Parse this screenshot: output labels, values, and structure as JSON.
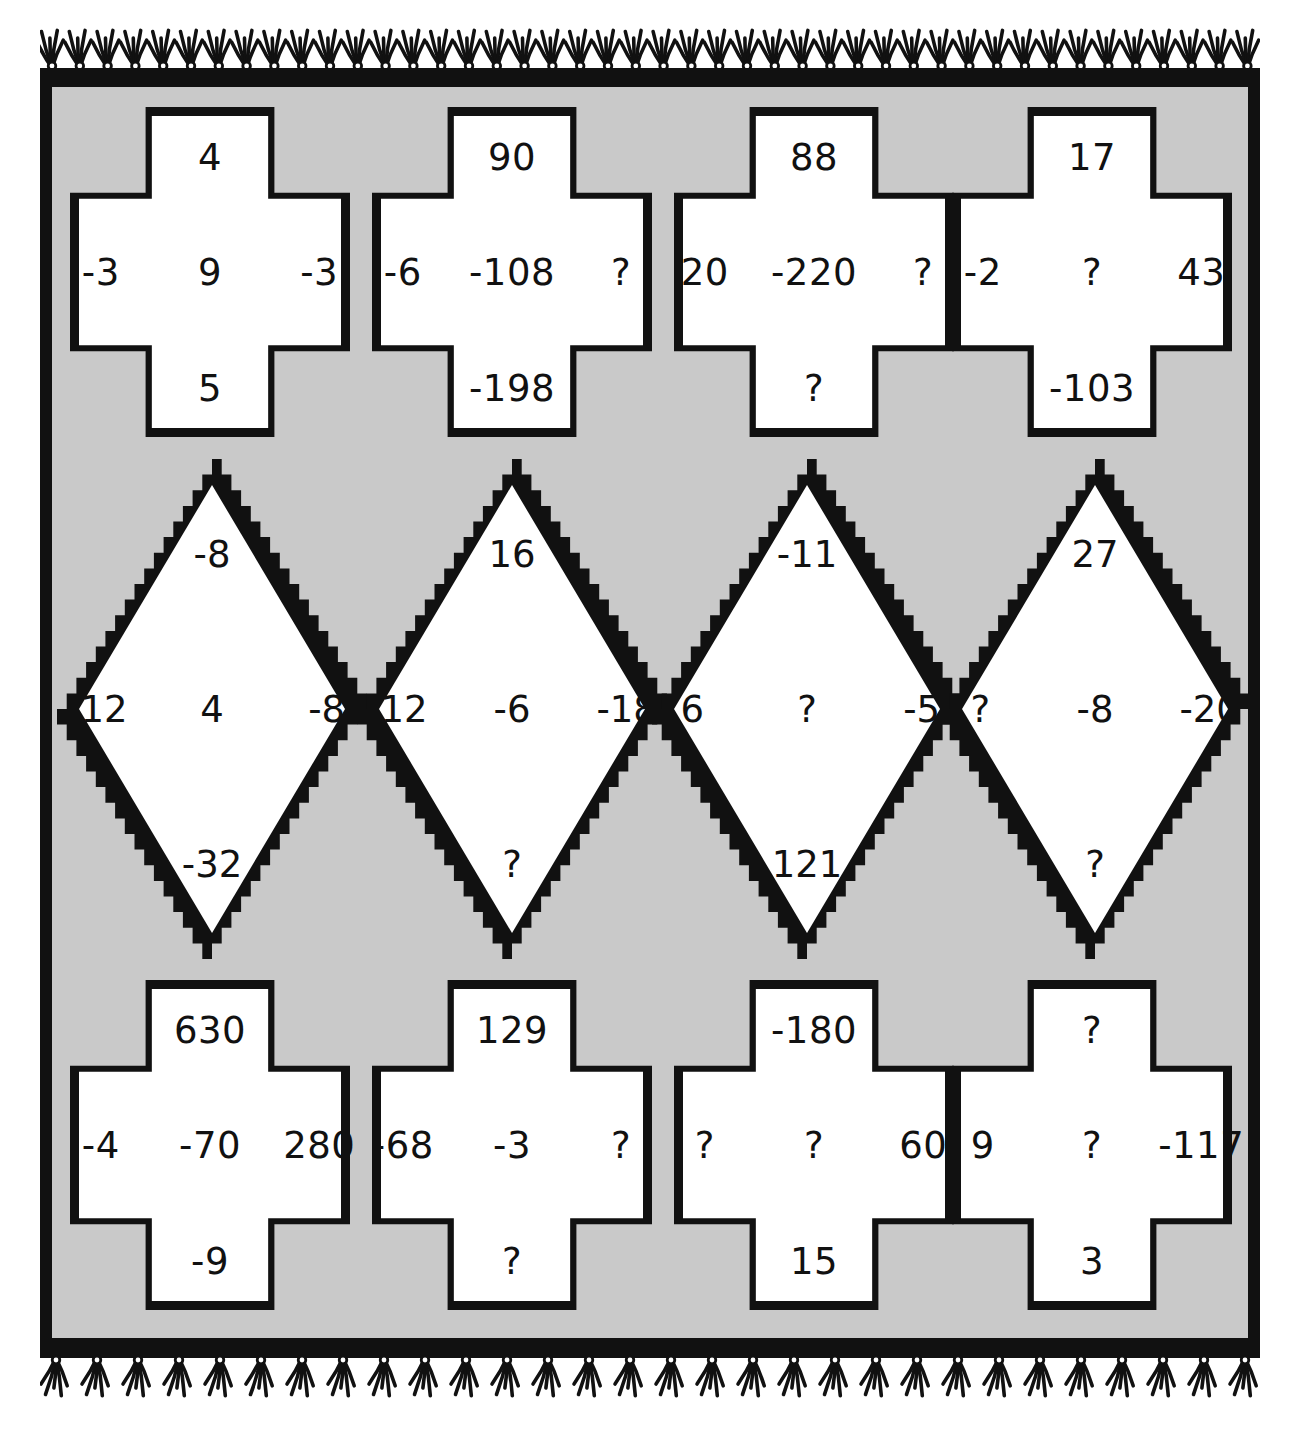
{
  "puzzle": {
    "background_color": "#c9c9c9",
    "ink_color": "#111111",
    "cell_fill_color": "#ffffff",
    "unknown_marker": "?",
    "top_row": [
      {
        "top": "4",
        "left": "-3",
        "center": "9",
        "right": "-3",
        "bottom": "5"
      },
      {
        "top": "90",
        "left": "-6",
        "center": "-108",
        "right": "?",
        "bottom": "-198"
      },
      {
        "top": "88",
        "left": "20",
        "center": "-220",
        "right": "?",
        "bottom": "?"
      },
      {
        "top": "17",
        "left": "-2",
        "center": "?",
        "right": "43",
        "bottom": "-103"
      }
    ],
    "middle_row": [
      {
        "top": "-8",
        "left": "-12",
        "center": "4",
        "right": "-8",
        "bottom": "-32"
      },
      {
        "top": "16",
        "left": "-12",
        "center": "-6",
        "right": "-18",
        "bottom": "?"
      },
      {
        "top": "-11",
        "left": "6",
        "center": "?",
        "right": "-5",
        "bottom": "121"
      },
      {
        "top": "27",
        "left": "?",
        "center": "-8",
        "right": "-20",
        "bottom": "?"
      }
    ],
    "bottom_row": [
      {
        "top": "630",
        "left": "-4",
        "center": "-70",
        "right": "280",
        "bottom": "-9"
      },
      {
        "top": "129",
        "left": "-68",
        "center": "-3",
        "right": "?",
        "bottom": "?"
      },
      {
        "top": "-180",
        "left": "?",
        "center": "?",
        "right": "60",
        "bottom": "15"
      },
      {
        "top": "?",
        "left": "9",
        "center": "?",
        "right": "-117",
        "bottom": "3"
      }
    ]
  }
}
